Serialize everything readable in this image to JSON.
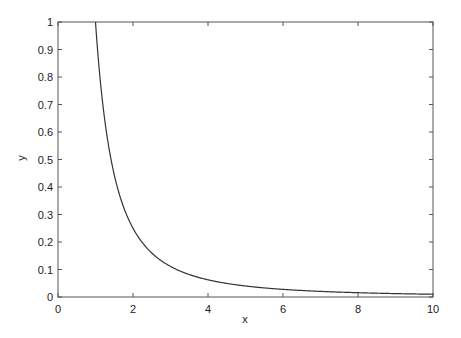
{
  "chart_data": {
    "type": "line",
    "title": "",
    "xlabel": "x",
    "ylabel": "y",
    "xlim": [
      0,
      10
    ],
    "ylim": [
      0,
      1
    ],
    "grid": false,
    "legend": null,
    "x_ticks": [
      0,
      2,
      4,
      6,
      8,
      10
    ],
    "y_ticks": [
      0,
      0.1,
      0.2,
      0.3,
      0.4,
      0.5,
      0.6,
      0.7,
      0.8,
      0.9,
      1
    ],
    "x_tick_labels": [
      "0",
      "2",
      "4",
      "6",
      "8",
      "10"
    ],
    "y_tick_labels": [
      "0",
      "0.1",
      "0.2",
      "0.3",
      "0.4",
      "0.5",
      "0.6",
      "0.7",
      "0.8",
      "0.9",
      "1"
    ],
    "series": [
      {
        "name": "y = 1/x^2",
        "x": [
          1,
          1.25,
          1.5,
          1.75,
          2,
          2.5,
          3,
          3.5,
          4,
          5,
          6,
          7,
          8,
          9,
          10
        ],
        "values": [
          1.0,
          0.64,
          0.444,
          0.327,
          0.25,
          0.16,
          0.111,
          0.082,
          0.0625,
          0.04,
          0.028,
          0.02,
          0.016,
          0.012,
          0.01
        ],
        "color": "#333333"
      }
    ]
  },
  "colors": {
    "axis": "#444444",
    "line": "#333333",
    "background": "#ffffff"
  }
}
